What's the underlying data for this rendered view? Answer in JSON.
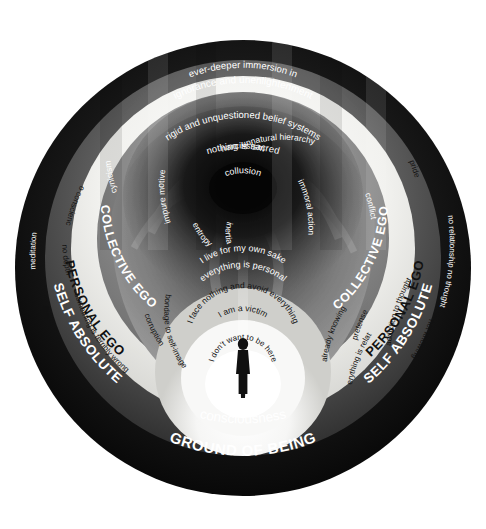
{
  "diagram": {
    "colors": {
      "background": "#ffffff",
      "ground_of_being": "#0a0a0a",
      "self_absolute_ring": "#4a4a4a",
      "personal_ego_ring": "#f2f2ef",
      "collective_ego_ring": "#8e8e8e",
      "vortex_dark": "#2b2b2b",
      "vortex_mid": "#6f6f6f",
      "inner_light": "#fbfbfa",
      "figure": "#111111"
    },
    "outer_ring": {
      "label": "GROUND OF BEING",
      "secondary_label": "consciousness"
    },
    "self_absolute": {
      "label_left": "SELF ABSOLUTE",
      "label_right": "SELF ABSOLUTE",
      "left_terms": [
        "meditation",
        "nothing is wrong"
      ],
      "right_terms": [
        "no relationship no thought",
        "not knowing"
      ]
    },
    "personal_ego": {
      "label_left": "PERSONAL EGO",
      "label_right": "PERSONAL EGO",
      "left_terms": [
        "no conscience",
        "no depth",
        "something is terribly wrong",
        "corruption",
        "bondage to self-image"
      ],
      "right_terms": [
        "pride",
        "pretense",
        "addiction to thought",
        "already knowing",
        "everything is relative"
      ]
    },
    "collective_ego": {
      "label_left": "COLLECTIVE EGO",
      "label_right": "COLLECTIVE EGO",
      "left_terms": [
        "cynicism",
        "impure motive"
      ],
      "right_terms": [
        "conflict",
        "unnatural hierarchy",
        "immoral action"
      ]
    },
    "vortex": {
      "top_lines": [
        "ever-deeper immersion in",
        "ignorance and unenlightenment",
        "rigid and unquestioned belief systems",
        "nothing is sacred"
      ],
      "core_terms": [
        "narcissism",
        "collusion",
        "entropy",
        "inertia"
      ]
    },
    "inner_arcs": [
      "I live for my own sake",
      "everything is personal",
      "I face nothing and avoid everything",
      "I am a victim",
      "I don't want to be here"
    ],
    "figure": {
      "name": "human-silhouette"
    }
  }
}
